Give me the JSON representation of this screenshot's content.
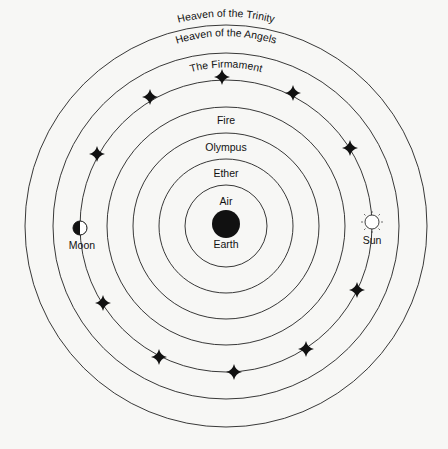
{
  "diagram": {
    "center": [
      226,
      226
    ],
    "spheres": [
      {
        "name": "Heaven of the Trinity",
        "radius": 201
      },
      {
        "name": "Heaven of the Angels",
        "radius": 173
      },
      {
        "name": "The Firmament",
        "radius": 146
      },
      {
        "name": "Fire",
        "radius": 119
      },
      {
        "name": "Olympus",
        "radius": 93
      },
      {
        "name": "Ether",
        "radius": 67
      },
      {
        "name": "Air",
        "radius": 41
      }
    ],
    "labels": {
      "trinity": "Heaven of the Trinity",
      "angels": "Heaven of the Angels",
      "firmament": "The Firmament",
      "fire": "Fire",
      "olympus": "Olympus",
      "ether": "Ether",
      "air": "Air",
      "earth": "Earth",
      "moon": "Moon",
      "sun": "Sun"
    },
    "colors": {
      "line": "#222222",
      "fill": "#111111",
      "background": "#f7f7f5"
    }
  }
}
